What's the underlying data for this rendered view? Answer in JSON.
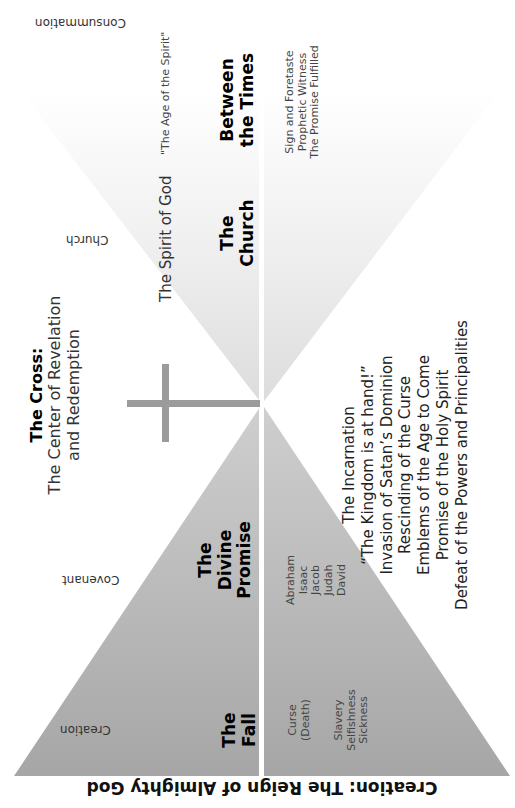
{
  "title": "Creation: The Reign of Almighty God",
  "timeline": {
    "creation": "Creation",
    "covenant": "Covenant",
    "church": "Church",
    "consummation": "Consummation"
  },
  "sections": {
    "fall": {
      "heading": "The Fall",
      "heading_lines": [
        "The",
        "Fall"
      ],
      "items": [
        "Curse",
        "(Death)",
        "",
        "Slavery",
        "Selfishness",
        "Sickness"
      ]
    },
    "promise": {
      "heading_lines": [
        "The",
        "Divine",
        "Promise"
      ],
      "items": [
        "Abraham",
        "Isaac",
        "Jacob",
        "Judah",
        "David"
      ]
    },
    "cross": {
      "heading": "The Cross:",
      "subtitle_lines": [
        "The Center of Revelation",
        "and Redemption"
      ],
      "events": [
        "The Incarnation",
        "“The Kingdom is at hand!”",
        "Invasion of Satan’s Dominion",
        "Rescinding of the Curse",
        "Emblems of the Age to Come",
        "Promise of the Holy Spirit",
        "Defeat of the Powers and Principalities"
      ]
    },
    "church": {
      "spirit": "The Spirit of God",
      "heading_lines": [
        "The",
        "Church"
      ]
    },
    "between": {
      "age": "\"The Age of the Spirit\"",
      "heading_lines": [
        "Between",
        "the Times"
      ],
      "items": [
        "Sign and Foretaste",
        "Prophetic Witness",
        "The Promise Fulfilled"
      ]
    }
  },
  "colors": {
    "triangle_dark": "#a9a9a9",
    "triangle_light": "#c8c8c8",
    "church_fade": "#e6e6e6",
    "cross": "#9a9a9a",
    "divider": "#ffffff"
  }
}
